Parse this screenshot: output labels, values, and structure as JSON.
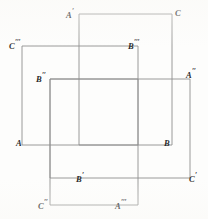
{
  "figure": {
    "kind": "geometry-diagram",
    "canvas": {
      "width": 208,
      "height": 219
    },
    "style": {
      "background_color": "#fdfdfc",
      "line_color": "#8f8f8f",
      "label_color": "#2b2b2b",
      "line_width": 0.9
    },
    "rectangles": [
      {
        "id": "rect-1",
        "name": "rectangle-A-prime-C",
        "x": 79,
        "y": 14,
        "width": 93,
        "height": 131,
        "path": "M 79 14 L 172 14 L 172 145 L 79 145 Z"
      },
      {
        "id": "rect-2",
        "name": "rectangle-C-triple-prime-B-triple-prime",
        "x": 22,
        "y": 46,
        "width": 116,
        "height": 99,
        "path": "M 22 46 L 138 46 L 138 145 L 22 145 Z"
      },
      {
        "id": "rect-3",
        "name": "rectangle-B-double-prime-A-double-prime",
        "x": 50,
        "y": 79,
        "width": 140,
        "height": 99,
        "path": "M 50 79 L 190 79 L 190 178 L 50 178 Z"
      },
      {
        "id": "rect-4",
        "name": "rectangle-B-prime-A-triple-prime",
        "x": 50,
        "y": 79,
        "width": 88,
        "height": 126,
        "path": "M 50 79 L 138 79 L 138 205 L 50 205 Z"
      }
    ],
    "labels": [
      {
        "id": "label-a-prime",
        "name": "vertex-label-a-prime",
        "base": "A",
        "primes": 1,
        "text": "A′",
        "x": 66,
        "y": 8,
        "align": "right"
      },
      {
        "id": "label-c",
        "name": "vertex-label-c",
        "base": "C",
        "primes": 0,
        "text": "C",
        "x": 175,
        "y": 9,
        "align": "left"
      },
      {
        "id": "label-c-triple-prime",
        "name": "vertex-label-c-triple-prime",
        "base": "C",
        "primes": 3,
        "text": "C‴",
        "x": 9,
        "y": 39,
        "align": "left"
      },
      {
        "id": "label-b-triple-prime",
        "name": "vertex-label-b-triple-prime",
        "base": "B",
        "primes": 3,
        "text": "B‴",
        "x": 128,
        "y": 39,
        "align": "left"
      },
      {
        "id": "label-b-double-prime",
        "name": "vertex-label-b-double-prime",
        "base": "B",
        "primes": 2,
        "text": "B″",
        "x": 36,
        "y": 72,
        "align": "left"
      },
      {
        "id": "label-a-double-prime",
        "name": "vertex-label-a-double-prime",
        "base": "A",
        "primes": 2,
        "text": "A″",
        "x": 186,
        "y": 68,
        "align": "left"
      },
      {
        "id": "label-a",
        "name": "vertex-label-a",
        "base": "A",
        "primes": 0,
        "text": "A",
        "x": 16,
        "y": 139,
        "align": "left"
      },
      {
        "id": "label-b",
        "name": "vertex-label-b",
        "base": "B",
        "primes": 0,
        "text": "B",
        "x": 164,
        "y": 139,
        "align": "left"
      },
      {
        "id": "label-b-prime",
        "name": "vertex-label-b-prime",
        "base": "B",
        "primes": 1,
        "text": "B′",
        "x": 76,
        "y": 172,
        "align": "left"
      },
      {
        "id": "label-c-prime",
        "name": "vertex-label-c-prime",
        "base": "C",
        "primes": 1,
        "text": "C′",
        "x": 189,
        "y": 172,
        "align": "left"
      },
      {
        "id": "label-c-double-prime",
        "name": "vertex-label-c-double-prime",
        "base": "C",
        "primes": 2,
        "text": "C″",
        "x": 38,
        "y": 199,
        "align": "left"
      },
      {
        "id": "label-a-triple-prime",
        "name": "vertex-label-a-triple-prime",
        "base": "A",
        "primes": 3,
        "text": "A‴",
        "x": 115,
        "y": 199,
        "align": "left"
      }
    ]
  }
}
